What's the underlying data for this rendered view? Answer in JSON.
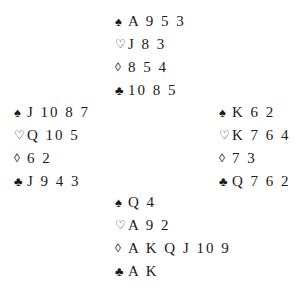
{
  "hands": {
    "north": {
      "spades": "A 9 5 3",
      "hearts": "J 8 3",
      "diamonds": "8 5 4",
      "clubs": "10 8 5"
    },
    "west": {
      "spades": "J 10 8 7",
      "hearts": "Q 10 5",
      "diamonds": "6 2",
      "clubs": "J 9 4 3"
    },
    "east": {
      "spades": "K 6 2",
      "hearts": "K 7 6 4",
      "diamonds": "7 3",
      "clubs": "Q 7 6 2"
    },
    "south": {
      "spades": "Q 4",
      "hearts": "A 9 2",
      "diamonds": "A K Q J 10 9",
      "clubs": "A K"
    }
  },
  "suit_symbols": {
    "spades": "♠",
    "hearts": "♡",
    "diamonds": "◊",
    "clubs": "♣"
  }
}
